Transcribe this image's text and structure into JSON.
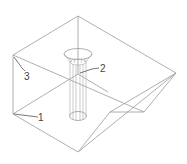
{
  "drawing": {
    "type": "isometric wireframe technical drawing",
    "subject": "hopper box with central funnel tube",
    "colors": {
      "background": "#ffffff",
      "edges": "#9a9a9a",
      "leaders": "#555555",
      "labels": "#444444"
    },
    "callouts": [
      {
        "id": "1",
        "text": "1"
      },
      {
        "id": "2",
        "text": "2"
      },
      {
        "id": "3",
        "text": "3"
      }
    ]
  }
}
